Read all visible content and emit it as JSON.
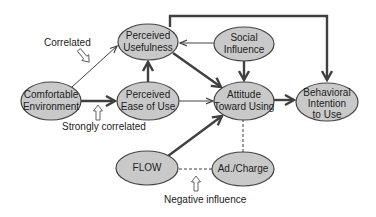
{
  "diagram": {
    "colors": {
      "node_fill": "#c9c9c9",
      "node_stroke": "#444444",
      "edge": "#404040",
      "background": "#ffffff"
    },
    "nodes": [
      {
        "id": "comfortable",
        "label_line1": "Comfortable",
        "label_line2": "Environment",
        "cx": 51,
        "cy": 101,
        "rx": 30,
        "ry": 19
      },
      {
        "id": "pu",
        "label_line1": "Perceived",
        "label_line2": "Usefulness",
        "cx": 148,
        "cy": 42,
        "rx": 30,
        "ry": 18
      },
      {
        "id": "peou",
        "label_line1": "Perceived",
        "label_line2": "Ease of Use",
        "cx": 148,
        "cy": 101,
        "rx": 31,
        "ry": 19
      },
      {
        "id": "social",
        "label_line1": "Social",
        "label_line2": "Influence",
        "cx": 244,
        "cy": 44,
        "rx": 30,
        "ry": 17
      },
      {
        "id": "attitude",
        "label_line1": "Attitude",
        "label_line2": "Toward Using",
        "cx": 244,
        "cy": 101,
        "rx": 30,
        "ry": 19
      },
      {
        "id": "bi",
        "label_line1": "Behavioral",
        "label_line2": "Intention",
        "label_line3": "to Use",
        "cx": 327,
        "cy": 102,
        "rx": 31,
        "ry": 19
      },
      {
        "id": "flow",
        "label_line1": "FLOW",
        "cx": 147,
        "cy": 168,
        "rx": 31,
        "ry": 17
      },
      {
        "id": "adcharge",
        "label_line1": "Ad./Charge",
        "cx": 243,
        "cy": 169,
        "rx": 31,
        "ry": 17
      }
    ],
    "annotations": {
      "correlated": "Correlated",
      "strongly_correlated": "Strongly correlated",
      "negative_influence": "Negative influence"
    },
    "edges": [
      {
        "from": "Comfortable Environment",
        "to": "Perceived Usefulness",
        "style": "thin"
      },
      {
        "from": "Comfortable Environment",
        "to": "Perceived Ease of Use",
        "style": "thick"
      },
      {
        "from": "Perceived Ease of Use",
        "to": "Perceived Usefulness",
        "style": "thick"
      },
      {
        "from": "Social Influence",
        "to": "Perceived Usefulness",
        "style": "thin"
      },
      {
        "from": "Perceived Usefulness",
        "to": "Attitude Toward Using",
        "style": "thick"
      },
      {
        "from": "Perceived Ease of Use",
        "to": "Attitude Toward Using",
        "style": "thin"
      },
      {
        "from": "Social Influence",
        "to": "Attitude Toward Using",
        "style": "thick"
      },
      {
        "from": "FLOW",
        "to": "Attitude Toward Using",
        "style": "thick"
      },
      {
        "from": "Attitude Toward Using",
        "to": "Behavioral Intention to Use",
        "style": "thick"
      },
      {
        "from": "Perceived Usefulness",
        "to": "Behavioral Intention to Use",
        "style": "thick-elbow"
      },
      {
        "from": "Ad./Charge",
        "to": "Attitude Toward Using",
        "style": "dashed"
      },
      {
        "from": "Ad./Charge",
        "to": "FLOW",
        "style": "dashed"
      }
    ]
  }
}
